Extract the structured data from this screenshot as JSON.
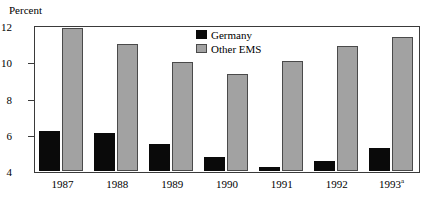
{
  "chart_data": {
    "type": "bar",
    "title": "",
    "xlabel": "",
    "ylabel": "Percent",
    "ylim": [
      4,
      12
    ],
    "yticks": [
      4,
      6,
      8,
      10,
      12
    ],
    "grid": false,
    "legend_position": "inside-top-center",
    "categories": [
      "1987",
      "1988",
      "1989",
      "1990",
      "1991",
      "1992",
      "1993"
    ],
    "category_labels": [
      {
        "text": "1987",
        "superscript": ""
      },
      {
        "text": "1988",
        "superscript": ""
      },
      {
        "text": "1989",
        "superscript": ""
      },
      {
        "text": "1990",
        "superscript": ""
      },
      {
        "text": "1991",
        "superscript": ""
      },
      {
        "text": "1992",
        "superscript": ""
      },
      {
        "text": "1993",
        "superscript": "a"
      }
    ],
    "series": [
      {
        "name": "Germany",
        "color": "#0a0a0a",
        "values": [
          6.2,
          6.1,
          5.5,
          4.75,
          4.2,
          4.55,
          5.25
        ]
      },
      {
        "name": "Other EMS",
        "color": "#a2a2a2",
        "values": [
          11.9,
          11.0,
          10.0,
          9.35,
          10.05,
          10.9,
          11.4
        ]
      }
    ]
  },
  "legend": {
    "entries": [
      {
        "label": "Germany",
        "swatch": "black-square-swatch"
      },
      {
        "label": "Other EMS",
        "swatch": "gray-square-swatch"
      }
    ]
  },
  "axis": {
    "y_title": "Percent"
  },
  "colors": {
    "germany": "#0a0a0a",
    "other_ems": "#a2a2a2",
    "frame": "#3a3a3a",
    "background": "#ffffff"
  }
}
